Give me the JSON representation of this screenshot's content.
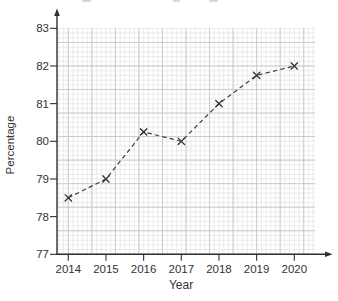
{
  "chart_data": {
    "type": "line",
    "categories": [
      "2014",
      "2015",
      "2016",
      "2017",
      "2018",
      "2019",
      "2020"
    ],
    "values": [
      78.5,
      79.0,
      80.25,
      80.0,
      81.0,
      81.75,
      82.0
    ],
    "title": "",
    "xlabel": "Year",
    "ylabel": "Percentage",
    "ylim": [
      77,
      83
    ],
    "yticks": [
      "77",
      "78",
      "79",
      "80",
      "81",
      "82",
      "83"
    ],
    "grid": {
      "style": "graph-paper",
      "minor_divisions_per_unit": 8,
      "minor_step_value": 0.125,
      "bold_every_minor": 5,
      "on": true
    },
    "line_style": "dashed",
    "marker": "x",
    "legend": null,
    "axis_arrows": true
  },
  "colors": {
    "background": "#ffffff",
    "axis": "#2f2f2f",
    "text": "#333333",
    "series": "#3f3f3f",
    "marker": "#333333",
    "grid_fine": "#dcdcdc",
    "grid_bold": "#c5c5c5",
    "top_edge_artifact": "#b0b0b0"
  },
  "artifacts": {
    "note": "illegible cut-off text remnants along the very top edge of the image"
  }
}
